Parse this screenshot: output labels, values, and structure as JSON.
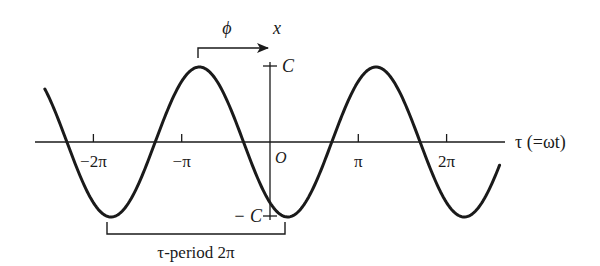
{
  "figure": {
    "labels": {
      "phase": "ϕ",
      "vertical_axis": "x",
      "amplitude_pos": "C",
      "amplitude_neg": "− C",
      "origin": "O",
      "horizontal_axis": "τ (=ωt)",
      "period": "τ-period 2π"
    },
    "ticks": [
      {
        "label": "−2π",
        "value": -2
      },
      {
        "label": "−π",
        "value": -1
      },
      {
        "label": "π",
        "value": 1
      },
      {
        "label": "2π",
        "value": 2
      }
    ],
    "curve": {
      "type": "cosine",
      "amplitude": "C",
      "peak_tau_over_pi": -0.8,
      "tau_range_over_pi": [
        -2.55,
        2.6
      ]
    },
    "colors": {
      "ink": "#1a1a1a",
      "background": "#ffffff"
    }
  }
}
